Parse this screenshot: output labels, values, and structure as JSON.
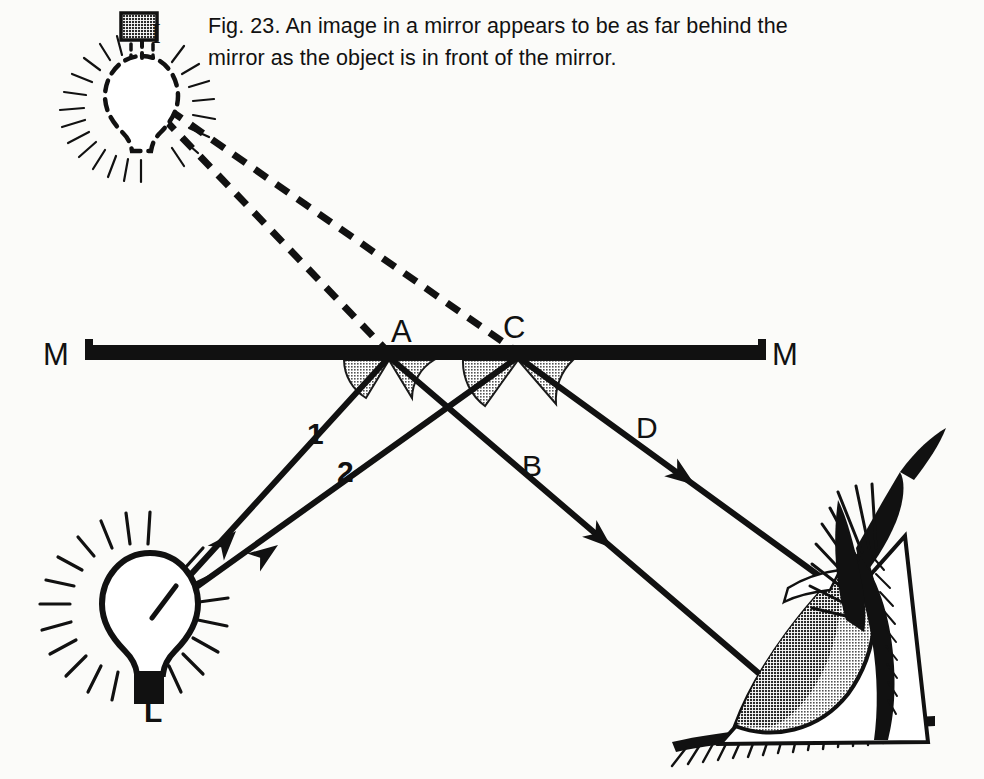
{
  "figure": {
    "caption": "Fig. 23. An image in a mirror appears to be as far behind the\nmirror as the object is in front of the mirror.",
    "caption_line1": "Fig. 23. An image in a mirror appears to be as far behind the",
    "caption_line2": "mirror as the object is in front of the mirror."
  },
  "colors": {
    "background": "#fbfbf9",
    "ink": "#111111",
    "shade": "#9d9d9d",
    "iris_dark": "#2a2a2a",
    "iris_light": "#8f8f8f"
  },
  "labels": {
    "image_bulb": "I",
    "source_bulb": "L",
    "mirror_left": "M",
    "mirror_right": "M",
    "point_a": "A",
    "point_c": "C",
    "ray_1": "1",
    "ray_2": "2",
    "ray_b": "B",
    "ray_d": "D"
  },
  "diagram": {
    "type": "ray-diagram",
    "mirror": {
      "name": "plane-mirror",
      "x1": 85,
      "x2": 766,
      "y": 352,
      "thickness": 15
    },
    "points": {
      "A": {
        "x": 389,
        "y": 352
      },
      "C": {
        "x": 518,
        "y": 352
      },
      "L": {
        "x": 150,
        "y": 618
      },
      "I": {
        "x": 142,
        "y": 96
      },
      "eye": {
        "x": 905,
        "y": 556
      }
    },
    "rays": [
      {
        "name": "ray-1-incident",
        "label": "1",
        "from": "L",
        "to": "A",
        "style": "solid",
        "arrow": true
      },
      {
        "name": "ray-2-incident",
        "label": "2",
        "from": "L",
        "to": "C",
        "style": "solid",
        "arrow": true
      },
      {
        "name": "ray-b-reflected",
        "label": "B",
        "from": "A",
        "to": "eye",
        "style": "solid",
        "arrow": true
      },
      {
        "name": "ray-d-reflected",
        "label": "D",
        "from": "C",
        "to": "eye",
        "style": "solid",
        "arrow": true
      },
      {
        "name": "virtual-ray-to-a",
        "label": "",
        "from": "I",
        "to": "A",
        "style": "dashed",
        "arrow": false
      },
      {
        "name": "virtual-ray-to-c",
        "label": "",
        "from": "I",
        "to": "C",
        "style": "dashed",
        "arrow": false
      }
    ],
    "angle_arcs": [
      {
        "name": "angle-incidence-a",
        "vertex": "A",
        "side": "left"
      },
      {
        "name": "angle-reflection-a",
        "vertex": "A",
        "side": "right"
      },
      {
        "name": "angle-incidence-c",
        "vertex": "C",
        "side": "left"
      },
      {
        "name": "angle-reflection-c",
        "vertex": "C",
        "side": "right"
      }
    ],
    "label_positions": {
      "I": {
        "x": 157,
        "y": 36
      },
      "L": {
        "x": 152,
        "y": 712
      },
      "M_left": {
        "x": 52,
        "y": 362
      },
      "M_right": {
        "x": 780,
        "y": 362
      },
      "A": {
        "x": 400,
        "y": 340
      },
      "C": {
        "x": 513,
        "y": 336
      },
      "1": {
        "x": 313,
        "y": 434
      },
      "2": {
        "x": 343,
        "y": 472
      },
      "B": {
        "x": 530,
        "y": 466
      },
      "D": {
        "x": 644,
        "y": 428
      }
    }
  },
  "icons": {
    "image_bulb": "dashed-lightbulb-icon",
    "source_bulb": "lightbulb-icon",
    "eye": "eye-icon",
    "mirror": "mirror-bar-icon",
    "arrowhead": "arrowhead-icon"
  }
}
